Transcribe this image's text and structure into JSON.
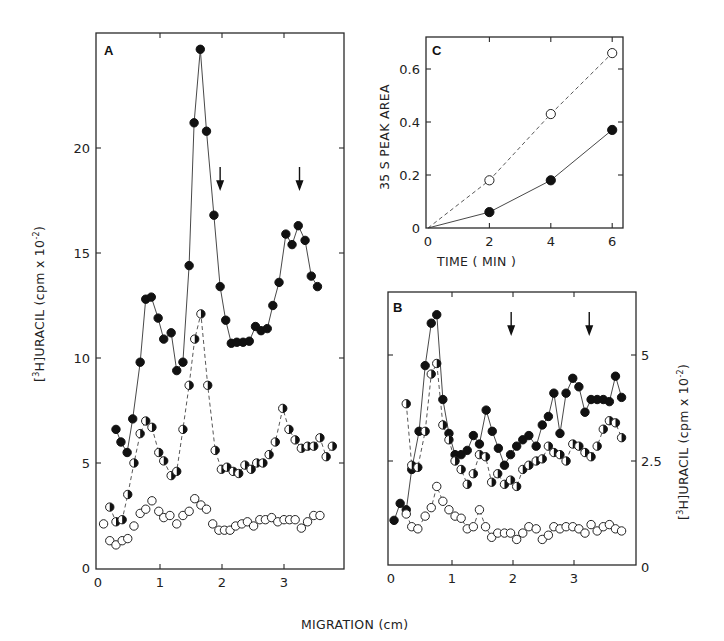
{
  "figure": {
    "shared_xlabel": "MIGRATION (cm)"
  },
  "chart_data": [
    {
      "panel": "A",
      "type": "line",
      "xlabel": "MIGRATION (cm)",
      "ylabel": "[3H]URACIL (cpm x 10^-2)",
      "ylabel_parts": {
        "pre": "[",
        "sup": "3",
        "mid": "H]URACIL  (cpm x 10",
        "sup2": "-2",
        "post": ")"
      },
      "xlim": [
        0,
        3.9
      ],
      "ylim": [
        0,
        25
      ],
      "xticks": [
        0,
        1,
        2,
        3
      ],
      "yticks": [
        0,
        5,
        10,
        15,
        20
      ],
      "xtick_labels": [
        "0",
        "1",
        "2",
        "3"
      ],
      "ytick_labels": [
        "0",
        "5",
        "10",
        "15",
        "20"
      ],
      "grid": false,
      "arrows_x": [
        1.97,
        3.25
      ],
      "series": [
        {
          "name": "filled circles",
          "marker": "filled",
          "line": "solid",
          "x": [
            0.29,
            0.37,
            0.47,
            0.56,
            0.68,
            0.77,
            0.86,
            0.97,
            1.06,
            1.18,
            1.27,
            1.37,
            1.47,
            1.55,
            1.65,
            1.75,
            1.87,
            1.97,
            2.06,
            2.15,
            2.24,
            2.34,
            2.44,
            2.54,
            2.63,
            2.73,
            2.82,
            2.92,
            3.03,
            3.13,
            3.23,
            3.34,
            3.44,
            3.54
          ],
          "y": [
            6.6,
            6.0,
            5.5,
            7.1,
            9.8,
            12.8,
            12.9,
            11.9,
            10.9,
            11.2,
            9.4,
            9.8,
            14.4,
            21.2,
            24.7,
            20.8,
            16.8,
            13.4,
            11.8,
            10.7,
            10.75,
            10.75,
            10.8,
            11.5,
            11.3,
            11.4,
            12.5,
            13.6,
            15.9,
            15.4,
            16.3,
            15.6,
            13.9,
            13.4
          ]
        },
        {
          "name": "half-filled circles",
          "marker": "half",
          "line": "dashed",
          "x": [
            0.19,
            0.29,
            0.39,
            0.48,
            0.58,
            0.68,
            0.77,
            0.87,
            0.98,
            1.06,
            1.18,
            1.27,
            1.37,
            1.47,
            1.56,
            1.66,
            1.77,
            1.89,
            1.99,
            2.08,
            2.18,
            2.27,
            2.37,
            2.47,
            2.56,
            2.66,
            2.76,
            2.86,
            2.98,
            3.08,
            3.18,
            3.28,
            3.38,
            3.48,
            3.58,
            3.68,
            3.78
          ],
          "y": [
            2.9,
            2.2,
            2.3,
            3.5,
            5.0,
            6.4,
            7.0,
            6.7,
            5.5,
            5.1,
            4.4,
            4.6,
            6.6,
            8.7,
            10.9,
            12.1,
            8.7,
            5.6,
            4.7,
            4.8,
            4.6,
            4.5,
            4.9,
            4.7,
            5.0,
            5.0,
            5.4,
            6.0,
            7.6,
            6.6,
            6.1,
            5.7,
            5.8,
            5.8,
            6.2,
            5.3,
            5.8
          ]
        },
        {
          "name": "open circles",
          "marker": "open",
          "line": "none",
          "x": [
            0.09,
            0.19,
            0.29,
            0.39,
            0.48,
            0.58,
            0.68,
            0.77,
            0.87,
            0.98,
            1.06,
            1.16,
            1.27,
            1.37,
            1.47,
            1.56,
            1.66,
            1.75,
            1.85,
            1.95,
            2.04,
            2.13,
            2.22,
            2.32,
            2.41,
            2.51,
            2.61,
            2.7,
            2.8,
            2.9,
            3.0,
            3.09,
            3.18,
            3.28,
            3.38,
            3.48,
            3.58
          ],
          "y": [
            2.1,
            1.3,
            1.1,
            1.3,
            1.4,
            2.0,
            2.6,
            2.8,
            3.2,
            2.7,
            2.4,
            2.5,
            2.1,
            2.5,
            2.7,
            3.3,
            3.0,
            2.8,
            2.1,
            1.8,
            1.8,
            1.8,
            2.0,
            2.1,
            2.2,
            2.0,
            2.3,
            2.3,
            2.4,
            2.2,
            2.3,
            2.3,
            2.3,
            1.9,
            2.2,
            2.5,
            2.5
          ]
        }
      ]
    },
    {
      "panel": "B",
      "type": "line",
      "xlabel": "MIGRATION (cm)",
      "ylabel": "[3H]URACIL (cpm x 10^-2)",
      "ylabel_position": "right",
      "xlim": [
        0,
        4.0
      ],
      "ylim": [
        0,
        6.5
      ],
      "xticks": [
        0,
        1,
        2,
        3
      ],
      "yticks": [
        0,
        2.5,
        5
      ],
      "xtick_labels": [
        "0",
        "1",
        "2",
        "3"
      ],
      "ytick_labels": [
        "0",
        "2.5",
        "5"
      ],
      "grid": false,
      "arrows_x": [
        1.97,
        3.25
      ],
      "series": [
        {
          "name": "filled circles",
          "marker": "filled",
          "line": "solid",
          "x": [
            0.05,
            0.15,
            0.25,
            0.34,
            0.46,
            0.56,
            0.66,
            0.75,
            0.85,
            0.95,
            1.05,
            1.15,
            1.25,
            1.35,
            1.45,
            1.56,
            1.66,
            1.76,
            1.86,
            1.96,
            2.06,
            2.16,
            2.26,
            2.38,
            2.48,
            2.58,
            2.67,
            2.77,
            2.87,
            2.98,
            3.08,
            3.18,
            3.28,
            3.38,
            3.48,
            3.58,
            3.68,
            3.78
          ],
          "y": [
            1.1,
            1.5,
            1.35,
            2.3,
            3.2,
            4.75,
            5.75,
            5.95,
            3.95,
            3.15,
            2.65,
            2.65,
            2.75,
            3.1,
            2.9,
            3.7,
            3.2,
            2.8,
            2.4,
            2.65,
            2.85,
            3.0,
            3.1,
            2.85,
            3.35,
            3.55,
            4.1,
            3.15,
            4.1,
            4.45,
            4.25,
            3.65,
            3.95,
            3.95,
            3.95,
            3.9,
            4.5,
            4.0
          ]
        },
        {
          "name": "half-filled circles",
          "marker": "half",
          "line": "dashed",
          "x": [
            0.25,
            0.34,
            0.44,
            0.56,
            0.66,
            0.75,
            0.85,
            0.95,
            1.05,
            1.15,
            1.25,
            1.35,
            1.45,
            1.55,
            1.65,
            1.75,
            1.86,
            1.96,
            2.06,
            2.16,
            2.26,
            2.38,
            2.48,
            2.58,
            2.67,
            2.77,
            2.87,
            2.98,
            3.08,
            3.18,
            3.28,
            3.38,
            3.48,
            3.58,
            3.68,
            3.78
          ],
          "y": [
            3.85,
            2.4,
            2.35,
            3.2,
            4.55,
            4.8,
            3.35,
            3.0,
            2.5,
            2.3,
            1.95,
            2.2,
            2.65,
            2.6,
            2.0,
            2.2,
            1.95,
            2.05,
            1.9,
            2.3,
            2.4,
            2.5,
            2.55,
            2.85,
            2.7,
            2.65,
            2.5,
            2.9,
            2.85,
            2.7,
            2.6,
            2.85,
            3.25,
            3.45,
            3.4,
            3.05
          ]
        },
        {
          "name": "open circles",
          "marker": "open",
          "line": "dashed",
          "x": [
            0.25,
            0.34,
            0.44,
            0.56,
            0.66,
            0.75,
            0.85,
            0.95,
            1.05,
            1.15,
            1.25,
            1.35,
            1.45,
            1.55,
            1.65,
            1.75,
            1.86,
            1.96,
            2.06,
            2.16,
            2.26,
            2.38,
            2.48,
            2.58,
            2.67,
            2.77,
            2.87,
            2.98,
            3.08,
            3.18,
            3.28,
            3.38,
            3.48,
            3.58,
            3.68,
            3.78
          ],
          "y": [
            1.25,
            0.95,
            0.9,
            1.2,
            1.4,
            1.9,
            1.55,
            1.35,
            1.2,
            1.15,
            0.9,
            0.95,
            1.35,
            0.95,
            0.7,
            0.8,
            0.8,
            0.8,
            0.65,
            0.8,
            0.95,
            0.9,
            0.65,
            0.75,
            0.95,
            0.9,
            0.95,
            0.95,
            0.9,
            0.8,
            1.0,
            0.85,
            0.95,
            1.0,
            0.9,
            0.85
          ]
        }
      ]
    },
    {
      "panel": "C",
      "type": "line",
      "xlabel": "TIME  ( MIN )",
      "ylabel": "35 S PEAK AREA",
      "xlim": [
        0,
        6.4
      ],
      "ylim": [
        0,
        0.72
      ],
      "xticks": [
        0,
        2,
        4,
        6
      ],
      "yticks": [
        0,
        0.2,
        0.4,
        0.6
      ],
      "xtick_labels": [
        "0",
        "2",
        "4",
        "6"
      ],
      "ytick_labels": [
        "0",
        "0.2",
        "0.4",
        "0.6"
      ],
      "grid": false,
      "series": [
        {
          "name": "open circles",
          "marker": "open",
          "line": "dashed",
          "x": [
            0,
            2,
            4,
            6
          ],
          "y": [
            0,
            0.18,
            0.43,
            0.66
          ]
        },
        {
          "name": "filled circles",
          "marker": "filled",
          "line": "solid",
          "x": [
            0,
            2,
            4,
            6
          ],
          "y": [
            0,
            0.06,
            0.18,
            0.37
          ]
        }
      ]
    }
  ]
}
